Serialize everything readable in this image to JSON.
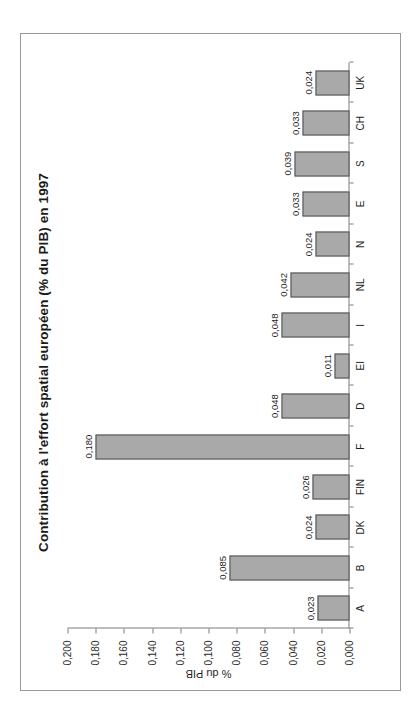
{
  "chart_data": {
    "type": "bar",
    "orientation": "vertical",
    "title": "Contribution à l'effort spatial européen (% du PIB) en 1997",
    "xlabel": "",
    "ylabel": "% du PIB",
    "categories": [
      "A",
      "B",
      "DK",
      "FIN",
      "F",
      "D",
      "EI",
      "I",
      "NL",
      "N",
      "E",
      "S",
      "CH",
      "UK"
    ],
    "values": [
      0.023,
      0.085,
      0.024,
      0.026,
      0.18,
      0.048,
      0.011,
      0.048,
      0.042,
      0.024,
      0.033,
      0.039,
      0.033,
      0.024
    ],
    "value_labels": [
      "0,023",
      "0,085",
      "0,024",
      "0,026",
      "0,180",
      "0,048",
      "0,011",
      "0,048",
      "0,042",
      "0,024",
      "0,033",
      "0,039",
      "0,033",
      "0,024"
    ],
    "ylim": [
      0.0,
      0.2
    ],
    "ytick_values": [
      0.0,
      0.02,
      0.04,
      0.06,
      0.08,
      0.1,
      0.12,
      0.14,
      0.16,
      0.18,
      0.2
    ],
    "ytick_labels": [
      "0,000",
      "0,020",
      "0,040",
      "0,060",
      "0,080",
      "0,100",
      "0,120",
      "0,140",
      "0,160",
      "0,180",
      "0,200"
    ],
    "grid": false,
    "legend": false,
    "bar_fill": "#a9a9a9",
    "bar_border": "#4e4e4e",
    "axis_color": "#7d7d7d",
    "frame_color": "#9a9a9a",
    "page_rotation_deg": -90
  }
}
